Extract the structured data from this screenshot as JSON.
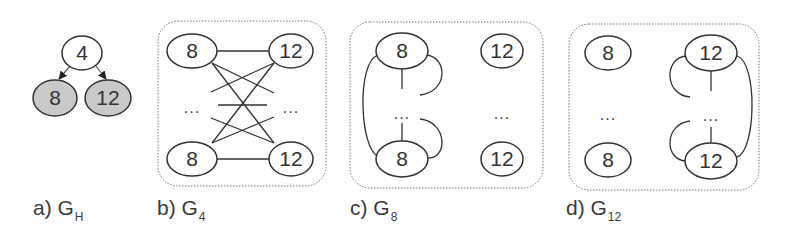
{
  "colors": {
    "stroke": "#333333",
    "leaf_fill": "#c9c9c9",
    "box_stroke": "#666666"
  },
  "panels": [
    {
      "id": "a",
      "caption": "a) G",
      "caption_sub": "H",
      "nodes": [
        {
          "label": "4",
          "role": "root"
        },
        {
          "label": "8",
          "role": "child"
        },
        {
          "label": "12",
          "role": "child"
        }
      ],
      "edges": "4 -> 8, 4 -> 12 (directed)"
    },
    {
      "id": "b",
      "caption": "b) G",
      "caption_sub": "4",
      "nodes": [
        {
          "label": "8"
        },
        {
          "label": "12"
        },
        {
          "label": "8"
        },
        {
          "label": "12"
        }
      ],
      "ellipsis_left": "...",
      "ellipsis_right": "...",
      "edges": "complete bipartite between 8-column and 12-column"
    },
    {
      "id": "c",
      "caption": "c) G",
      "caption_sub": "8",
      "nodes": [
        {
          "label": "8"
        },
        {
          "label": "12"
        },
        {
          "label": "8"
        },
        {
          "label": "12"
        }
      ],
      "ellipsis_left": "...",
      "ellipsis_right": "...",
      "edges": "clique among 8 nodes"
    },
    {
      "id": "d",
      "caption": "d) G",
      "caption_sub": "12",
      "nodes": [
        {
          "label": "8"
        },
        {
          "label": "12"
        },
        {
          "label": "8"
        },
        {
          "label": "12"
        }
      ],
      "ellipsis_left": "...",
      "ellipsis_right": "...",
      "edges": "clique among 12 nodes"
    }
  ]
}
